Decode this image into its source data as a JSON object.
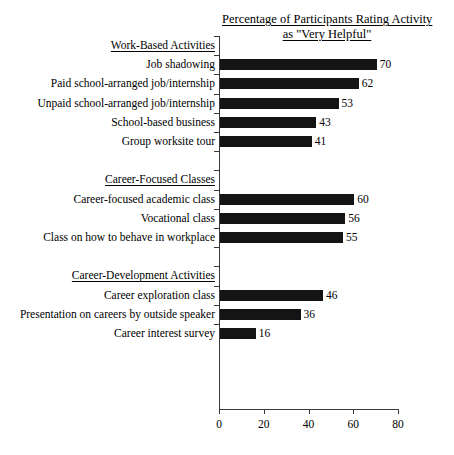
{
  "chart_data": {
    "type": "bar",
    "orientation": "horizontal",
    "title": "Percentage of Participants Rating Activity as \"Very Helpful\"",
    "title_lines": [
      "Percentage of Participants Rating Activity",
      "as \"Very Helpful\""
    ],
    "xlabel": "",
    "ylabel": "",
    "xlim": [
      0,
      80
    ],
    "xticks": [
      0,
      20,
      40,
      60,
      80
    ],
    "xtick_labels": [
      "0",
      "20",
      "40",
      "60",
      "80"
    ],
    "grid": false,
    "legend": null,
    "bar_color": "#141414",
    "axis_color": "#3a3a3a",
    "categories": [
      "Job shadowing",
      "Paid school-arranged job/internship",
      "Unpaid school-arranged job/internship",
      "School-based business",
      "Group worksite tour",
      "Career-focused academic class",
      "Vocational class",
      "Class on how to behave in workplace",
      "Career exploration class",
      "Presentation on careers by outside speaker",
      "Career interest survey"
    ],
    "values": [
      70,
      62,
      53,
      43,
      41,
      60,
      56,
      55,
      46,
      36,
      16
    ],
    "groups": [
      {
        "label": "Work-Based Activities",
        "categories": [
          "Job shadowing",
          "Paid school-arranged job/internship",
          "Unpaid school-arranged job/internship",
          "School-based business",
          "Group worksite tour"
        ],
        "values": [
          70,
          62,
          53,
          43,
          41
        ]
      },
      {
        "label": "Career-Focused Classes",
        "categories": [
          "Career-focused academic class",
          "Vocational class",
          "Class on how to behave in workplace"
        ],
        "values": [
          60,
          56,
          55
        ]
      },
      {
        "label": "Career-Development Activities",
        "categories": [
          "Career exploration class",
          "Presentation on careers by outside speaker",
          "Career interest survey"
        ],
        "values": [
          46,
          36,
          16
        ]
      }
    ]
  },
  "rows": [
    {
      "kind": "group",
      "label": "Work-Based Activities"
    },
    {
      "kind": "bar",
      "label": "Job shadowing",
      "value": 70
    },
    {
      "kind": "bar",
      "label": "Paid school-arranged job/internship",
      "value": 62
    },
    {
      "kind": "bar",
      "label": "Unpaid school-arranged job/internship",
      "value": 53
    },
    {
      "kind": "bar",
      "label": "School-based business",
      "value": 43
    },
    {
      "kind": "bar",
      "label": "Group worksite tour",
      "value": 41
    },
    {
      "kind": "spacer",
      "label": ""
    },
    {
      "kind": "group",
      "label": "Career-Focused Classes"
    },
    {
      "kind": "bar",
      "label": "Career-focused academic class",
      "value": 60
    },
    {
      "kind": "bar",
      "label": "Vocational class",
      "value": 56
    },
    {
      "kind": "bar",
      "label": "Class on how to behave in workplace",
      "value": 55
    },
    {
      "kind": "spacer",
      "label": ""
    },
    {
      "kind": "group",
      "label": "Career-Development Activities"
    },
    {
      "kind": "bar",
      "label": "Career exploration class",
      "value": 46
    },
    {
      "kind": "bar",
      "label": "Presentation on careers by outside speaker",
      "value": 36
    },
    {
      "kind": "bar",
      "label": "Career interest survey",
      "value": 16
    }
  ]
}
